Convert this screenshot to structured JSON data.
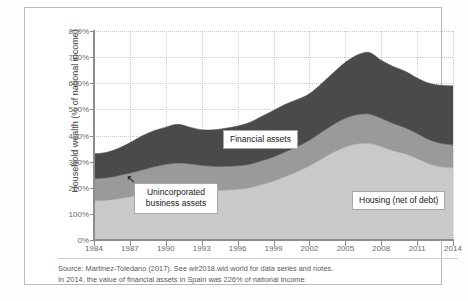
{
  "chart_data": {
    "type": "area",
    "stacked": true,
    "title": "",
    "subtitle": "",
    "xlabel": "",
    "ylabel": "Household wealth (% of national income)",
    "xlim": [
      1984,
      2014
    ],
    "ylim": [
      0,
      800
    ],
    "ytick_labels": [
      "0%",
      "100%",
      "200%",
      "300%",
      "400%",
      "500%",
      "600%",
      "700%",
      "800%"
    ],
    "ytick_values": [
      0,
      100,
      200,
      300,
      400,
      500,
      600,
      700,
      800
    ],
    "xtick_labels": [
      "1984",
      "1987",
      "1990",
      "1993",
      "1996",
      "1999",
      "2002",
      "2005",
      "2008",
      "2011",
      "2014"
    ],
    "xtick_values": [
      1984,
      1987,
      1990,
      1993,
      1996,
      1999,
      2002,
      2005,
      2008,
      2011,
      2014
    ],
    "grid": true,
    "legend_position": "inline-callouts",
    "x": [
      1984,
      1985,
      1986,
      1987,
      1988,
      1989,
      1990,
      1991,
      1992,
      1993,
      1994,
      1995,
      1996,
      1997,
      1998,
      1999,
      2000,
      2001,
      2002,
      2003,
      2004,
      2005,
      2006,
      2007,
      2008,
      2009,
      2010,
      2011,
      2012,
      2013,
      2014
    ],
    "series": [
      {
        "name": "Housing (net of debt)",
        "color": "#c9c9c9",
        "values": [
          150,
          152,
          158,
          166,
          176,
          186,
          194,
          198,
          196,
          192,
          190,
          191,
          194,
          200,
          212,
          226,
          244,
          262,
          284,
          310,
          336,
          356,
          368,
          370,
          358,
          342,
          330,
          312,
          292,
          280,
          276
        ]
      },
      {
        "name": "Unincorporated business assets",
        "color": "#9a9a9a",
        "values": [
          85,
          86,
          88,
          90,
          92,
          94,
          96,
          97,
          96,
          94,
          92,
          91,
          90,
          90,
          91,
          92,
          94,
          96,
          98,
          102,
          106,
          110,
          112,
          112,
          108,
          104,
          100,
          96,
          92,
          90,
          88
        ]
      },
      {
        "name": "Financial assets",
        "color": "#4a4a4a",
        "values": [
          95,
          97,
          104,
          116,
          130,
          138,
          142,
          148,
          140,
          136,
          140,
          146,
          152,
          160,
          170,
          178,
          182,
          180,
          178,
          186,
          198,
          214,
          228,
          236,
          222,
          218,
          216,
          212,
          216,
          222,
          226
        ]
      }
    ],
    "callouts": [
      {
        "id": "financial",
        "label": "Financial assets"
      },
      {
        "id": "unincorporated",
        "label": "Unincorporated business assets"
      },
      {
        "id": "housing",
        "label": "Housing (net of debt)"
      }
    ],
    "annotations": {
      "arrow_marker": "↖"
    }
  },
  "footer": {
    "line1": "Source: Martinez-Toledano (2017). See wir2018.wid.world for data series and notes.",
    "line2": "In 2014, the value of financial assets in Spain was 226% of national income."
  },
  "colors": {
    "housing": "#c9c9c9",
    "unincorporated": "#9a9a9a",
    "financial": "#4a4a4a",
    "axis": "#8d8d8d",
    "grid": "#c9c9c9",
    "frame": "#b9b9b9"
  }
}
